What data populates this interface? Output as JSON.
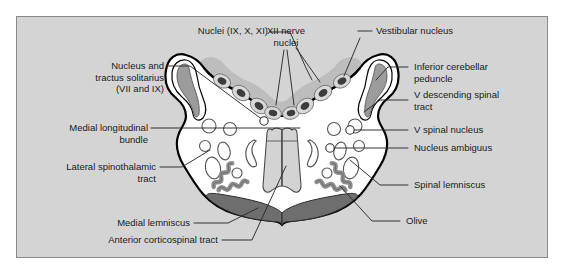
{
  "figure": {
    "kind": "anatomical-cross-section",
    "frame_color": "#d4d4d4",
    "frame_border_color": "#8a8a8a",
    "background_color": "#ffffff"
  },
  "palette": {
    "parenchyma_white": "#ffffff",
    "outline_black": "#000000",
    "peduncle_gray": "#9c9c9c",
    "nuclei_band_gray": "#b4b4b4",
    "nucleus_dot_dark": "#4a4a4a",
    "olive_squiggle_gray": "#9a9a9a",
    "medial_lemniscus_gray": "#6e6e6e",
    "pyramid_gray": "#d0d0d0",
    "leader_line": "#2b2b2b"
  },
  "labels": {
    "nuclei_ix_x_xi": "Nuclei (IX, X, XI)",
    "xii_nerve_nuclei_line1": "XII nerve",
    "xii_nerve_nuclei_line2": "nuclei",
    "vestibular_nucleus": "Vestibular nucleus",
    "nucleus_tractus_solitarius_line1": "Nucleus and",
    "nucleus_tractus_solitarius_line2": "tractus solitarius",
    "nucleus_tractus_solitarius_line3": "(VII and IX)",
    "inferior_cerebellar_peduncle_line1": "Inferior cerebellar",
    "inferior_cerebellar_peduncle_line2": "peduncle",
    "v_descending_spinal_tract_line1": "V descending spinal",
    "v_descending_spinal_tract_line2": "tract",
    "medial_longitudinal_bundle_line1": "Medial longitudinal",
    "medial_longitudinal_bundle_line2": "bundle",
    "v_spinal_nucleus": "V spinal nucleus",
    "nucleus_ambiguus": "Nucleus ambiguus",
    "lateral_spinothalamic_tract_line1": "Lateral spinothalamic",
    "lateral_spinothalamic_tract_line2": "tract",
    "spinal_lemniscus": "Spinal lemniscus",
    "medial_lemniscus": "Medial lemniscus",
    "olive": "Olive",
    "anterior_corticospinal_tract": "Anterior corticospinal tract"
  }
}
